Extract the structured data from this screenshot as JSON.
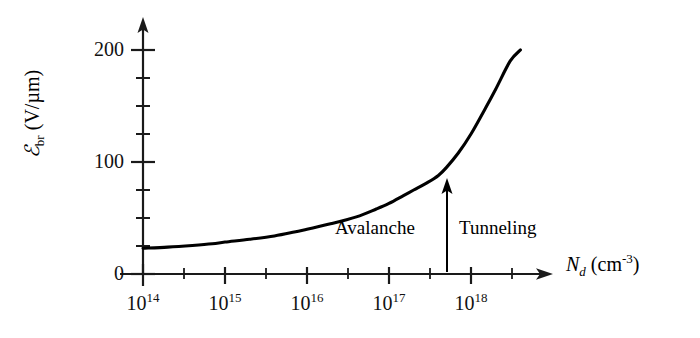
{
  "chart_data": {
    "type": "line",
    "title": "",
    "subtitle": "",
    "xlabel_parts": {
      "symbol": "N",
      "symbol_sub": "d",
      "units": "(cm",
      "units_sup": "-3",
      "units_close": ")"
    },
    "xlabel": "N_d (cm^-3)",
    "ylabel_parts": {
      "symbol": "ℰ",
      "symbol_sub": "br",
      "units": "(V/µm)"
    },
    "ylabel": "E_br (V/µm)",
    "x_scale": "log",
    "y_scale": "linear",
    "xlim": [
      100000000000000.0,
      4e+18
    ],
    "ylim": [
      0,
      215
    ],
    "x_tick_labels": [
      "10^14",
      "10^15",
      "10^16",
      "10^17",
      "10^18"
    ],
    "x_tick_mantissa": "10",
    "x_tick_exponents": [
      "14",
      "15",
      "16",
      "17",
      "18"
    ],
    "x_tick_values": [
      100000000000000.0,
      1000000000000000.0,
      1e+16,
      1e+17,
      1e+18
    ],
    "x_minor_ticks_per_decade": 1,
    "y_tick_labels": [
      "0",
      "100",
      "200"
    ],
    "y_tick_values": [
      0,
      100,
      200
    ],
    "y_minor_tick_step": 25,
    "grid": false,
    "legend": "none",
    "series": [
      {
        "name": "Breakdown field",
        "color": "#000000",
        "x": [
          100000000000000.0,
          200000000000000.0,
          400000000000000.0,
          700000000000000.0,
          1000000000000000.0,
          2000000000000000.0,
          4000000000000000.0,
          7000000000000000.0,
          1e+16,
          2e+16,
          4e+16,
          7e+16,
          1e+17,
          1.5e+17,
          2e+17,
          3e+17,
          4e+17,
          5e+17,
          7e+17,
          1e+18,
          1.5e+18,
          2e+18,
          3e+18,
          4e+18
        ],
        "y": [
          23,
          24,
          25.5,
          27,
          28.5,
          31,
          34,
          37.5,
          40,
          45,
          51,
          58,
          63,
          70,
          75,
          82,
          88,
          95,
          108,
          125,
          148,
          165,
          190,
          200
        ]
      }
    ],
    "annotations": [
      {
        "name": "region-divider-arrow",
        "type": "arrow",
        "x": 4e+17,
        "y_start": 0,
        "y_end": 88,
        "direction": "up",
        "color": "#000000"
      },
      {
        "name": "avalanche-label",
        "type": "text",
        "text": "Avalanche",
        "x": 5e+16,
        "y": 30
      },
      {
        "name": "tunneling-label",
        "type": "text",
        "text": "Tunneling",
        "x": 8e+17,
        "y": 30
      }
    ]
  },
  "axes": {
    "y_ticks": [
      {
        "label": "200",
        "value": 200
      },
      {
        "label": "100",
        "value": 100
      },
      {
        "label": "0",
        "value": 0
      }
    ],
    "x_ticks": [
      {
        "mantissa": "10",
        "exponent": "14"
      },
      {
        "mantissa": "10",
        "exponent": "15"
      },
      {
        "mantissa": "10",
        "exponent": "16"
      },
      {
        "mantissa": "10",
        "exponent": "17"
      },
      {
        "mantissa": "10",
        "exponent": "18"
      }
    ],
    "y_title": {
      "symbol": "ℰ",
      "sub": "br",
      "units": "(V/µm)"
    },
    "x_title": {
      "symbol": "N",
      "sub": "d",
      "units_open": "(cm",
      "units_sup": "-3",
      "units_close": ")"
    }
  },
  "labels": {
    "avalanche": "Avalanche",
    "tunneling": "Tunneling"
  },
  "colors": {
    "curve": "#000000",
    "axis": "#1a1a1a",
    "background": "#ffffff",
    "text": "#111111"
  }
}
